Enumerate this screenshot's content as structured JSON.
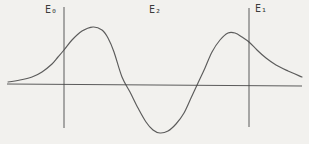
{
  "figure": {
    "kind": "wavefunction-diagram",
    "background": "#f2f1ee",
    "ink_color": "#474747",
    "labels": {
      "e0": "E₀",
      "e2": "E₂",
      "e1": "E₁"
    },
    "diagram": {
      "width": 309,
      "height": 144,
      "axis": {
        "x1": 7,
        "y1": 84,
        "x2": 302,
        "y2": 86
      },
      "left_boundary": {
        "x": 64,
        "y1": 7,
        "y2": 128
      },
      "right_boundary": {
        "x": 249,
        "y1": 8,
        "y2": 127
      },
      "curve_points": [
        [
          8,
          82
        ],
        [
          20,
          80
        ],
        [
          32,
          77
        ],
        [
          42,
          72
        ],
        [
          52,
          64
        ],
        [
          58,
          57
        ],
        [
          64,
          50
        ],
        [
          72,
          40
        ],
        [
          82,
          31
        ],
        [
          93,
          27
        ],
        [
          102,
          30
        ],
        [
          108,
          38
        ],
        [
          114,
          52
        ],
        [
          122,
          77
        ],
        [
          130,
          92
        ],
        [
          138,
          108
        ],
        [
          146,
          122
        ],
        [
          153,
          130
        ],
        [
          160,
          133
        ],
        [
          168,
          131
        ],
        [
          176,
          124
        ],
        [
          184,
          113
        ],
        [
          191,
          98
        ],
        [
          198,
          83
        ],
        [
          205,
          68
        ],
        [
          212,
          52
        ],
        [
          220,
          40
        ],
        [
          228,
          33
        ],
        [
          235,
          33
        ],
        [
          242,
          37
        ],
        [
          249,
          42
        ],
        [
          257,
          50
        ],
        [
          266,
          58
        ],
        [
          276,
          65
        ],
        [
          288,
          71
        ],
        [
          302,
          77
        ]
      ]
    }
  }
}
